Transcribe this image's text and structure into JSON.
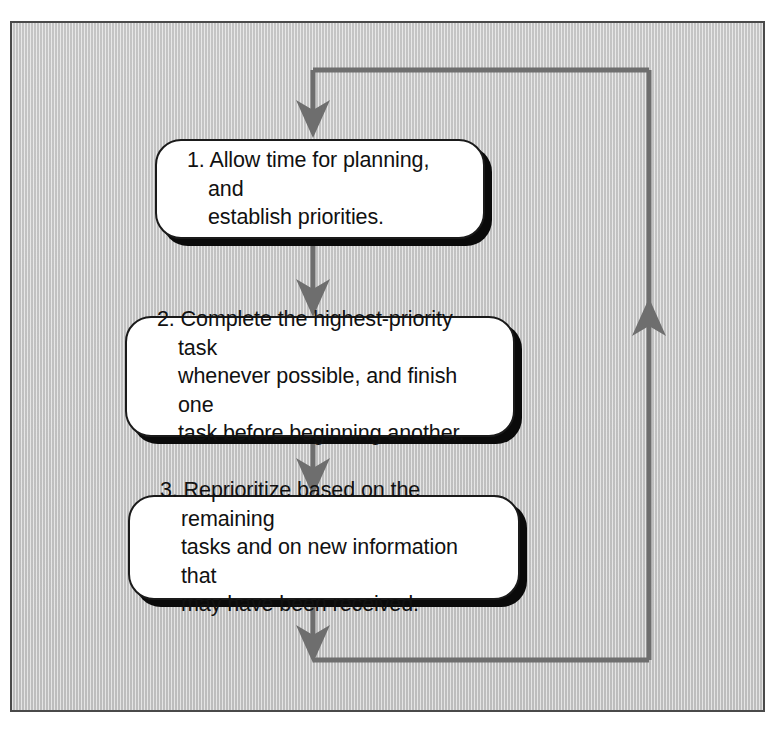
{
  "diagram": {
    "type": "flowchart",
    "orientation": "vertical-loop",
    "background_color": "#c9c9c9",
    "frame_border_color": "#4a4a4a",
    "node_fill_color": "#ffffff",
    "node_border_color": "#1a1a1a",
    "node_shadow_color": "#0a0a0a",
    "connector_color": "#6e6e6e"
  },
  "nodes": [
    {
      "id": "step-1",
      "number": "1.",
      "text": "1. Allow time for planning, and\nestablish priorities."
    },
    {
      "id": "step-2",
      "number": "2.",
      "text": "2. Complete the highest-priority task\nwhenever possible, and finish one\ntask before beginning another."
    },
    {
      "id": "step-3",
      "number": "3.",
      "text": "3. Reprioritize based on the remaining\ntasks and on new information that\nmay have been received."
    }
  ],
  "connectors": [
    {
      "id": "entry-arrow",
      "from": "loop-top",
      "to": "step-1",
      "direction": "down",
      "arrowhead": true
    },
    {
      "id": "arrow-1-to-2",
      "from": "step-1",
      "to": "step-2",
      "direction": "down",
      "arrowhead": true
    },
    {
      "id": "arrow-2-to-3",
      "from": "step-2",
      "to": "step-3",
      "direction": "down",
      "arrowhead": true
    },
    {
      "id": "exit-arrow",
      "from": "step-3",
      "to": "loop-bottom",
      "direction": "down",
      "arrowhead": true
    },
    {
      "id": "feedback-loop",
      "from": "loop-bottom",
      "to": "loop-top",
      "direction": "up",
      "arrowhead": true
    }
  ]
}
